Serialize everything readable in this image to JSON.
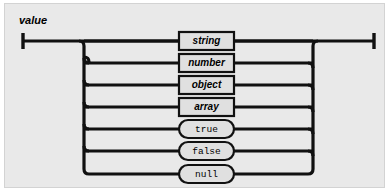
{
  "diagram": {
    "title": "value",
    "type": "railroad-syntax-diagram",
    "colors": {
      "panel_background": "#e9e9e9",
      "page_background": "#ffffff",
      "rail_stroke": "#111111",
      "node_fill": "#e0e0e0",
      "node_stroke": "#111111",
      "text": "#000000"
    },
    "entry_terminal": "start-bar",
    "exit_terminal": "end-bar",
    "alternatives": [
      {
        "id": "string",
        "label": "string",
        "kind": "nonterminal",
        "shape": "rectangle"
      },
      {
        "id": "number",
        "label": "number",
        "kind": "nonterminal",
        "shape": "rectangle"
      },
      {
        "id": "object",
        "label": "object",
        "kind": "nonterminal",
        "shape": "rectangle"
      },
      {
        "id": "array",
        "label": "array",
        "kind": "nonterminal",
        "shape": "rectangle"
      },
      {
        "id": "true",
        "label": "true",
        "kind": "literal",
        "shape": "capsule"
      },
      {
        "id": "false",
        "label": "false",
        "kind": "literal",
        "shape": "capsule"
      },
      {
        "id": "null",
        "label": "null",
        "kind": "literal",
        "shape": "capsule"
      }
    ]
  }
}
